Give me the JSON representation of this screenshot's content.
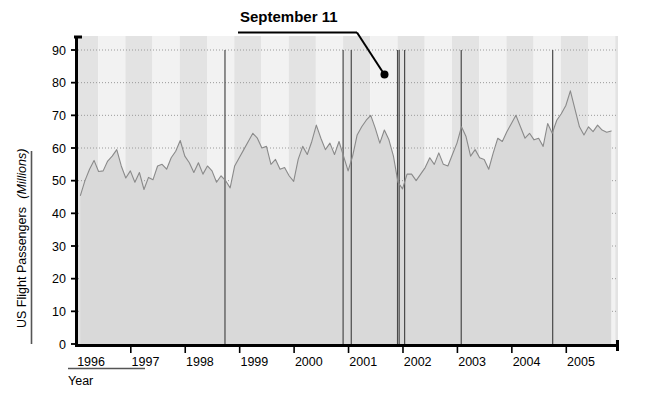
{
  "chart_data": {
    "type": "area",
    "title": "",
    "xlabel": "Year",
    "ylabel": "US Flight Passengers",
    "ylabel_unit": "(Millions)",
    "ylim": [
      0,
      90
    ],
    "xlim": [
      1995.58,
      2005.5
    ],
    "grid": true,
    "grid_style": "dotted-horizontal",
    "legend": "none",
    "ytick_labels": [
      "0",
      "10",
      "20",
      "30",
      "40",
      "50",
      "60",
      "70",
      "80",
      "90"
    ],
    "ytick_values": [
      0,
      10,
      20,
      30,
      40,
      50,
      60,
      70,
      80,
      90
    ],
    "xtick_labels": [
      "1996",
      "1997",
      "1998",
      "1999",
      "2000",
      "2001",
      "2002",
      "2003",
      "2004",
      "2005"
    ],
    "xtick_values": [
      1996,
      1997,
      1998,
      1999,
      2000,
      2001,
      2002,
      2003,
      2004,
      2005
    ],
    "series_name": "US Flight Passengers (Millions)",
    "line_color": "#8a8a8a",
    "fill_color": "#d9d9d9",
    "band_color": "#e3e3e3",
    "band_color_light": "#f2f2f2",
    "annotations": [
      {
        "label": "September  11",
        "x": 2001.7,
        "y": 81.5,
        "leader": true,
        "underline": true
      }
    ],
    "event_lines": [
      1998.28,
      2000.45,
      2000.6,
      2001.45,
      2001.48,
      2001.58,
      2002.62,
      2004.3
    ],
    "x": [
      1995.625,
      1995.708,
      1995.792,
      1995.875,
      1995.958,
      1996.042,
      1996.125,
      1996.208,
      1996.292,
      1996.375,
      1996.458,
      1996.542,
      1996.625,
      1996.708,
      1996.792,
      1996.875,
      1996.958,
      1997.042,
      1997.125,
      1997.208,
      1997.292,
      1997.375,
      1997.458,
      1997.542,
      1997.625,
      1997.708,
      1997.792,
      1997.875,
      1997.958,
      1998.042,
      1998.125,
      1998.208,
      1998.292,
      1998.375,
      1998.458,
      1998.542,
      1998.625,
      1998.708,
      1998.792,
      1998.875,
      1998.958,
      1999.042,
      1999.125,
      1999.208,
      1999.292,
      1999.375,
      1999.458,
      1999.542,
      1999.625,
      1999.708,
      1999.792,
      1999.875,
      1999.958,
      2000.042,
      2000.125,
      2000.208,
      2000.292,
      2000.375,
      2000.458,
      2000.542,
      2000.625,
      2000.708,
      2000.792,
      2000.875,
      2000.958,
      2001.042,
      2001.125,
      2001.208,
      2001.292,
      2001.375,
      2001.458,
      2001.542,
      2001.625,
      2001.708,
      2001.792,
      2001.875,
      2001.958,
      2002.042,
      2002.125,
      2002.208,
      2002.292,
      2002.375,
      2002.458,
      2002.542,
      2002.625,
      2002.708,
      2002.792,
      2002.875,
      2002.958,
      2003.042,
      2003.125,
      2003.208,
      2003.292,
      2003.375,
      2003.458,
      2003.542,
      2003.625,
      2003.708,
      2003.792,
      2003.875,
      2003.958,
      2004.042,
      2004.125,
      2004.208,
      2004.292,
      2004.375,
      2004.458,
      2004.542,
      2004.625,
      2004.708,
      2004.792,
      2004.875,
      2004.958,
      2005.042,
      2005.125,
      2005.208,
      2005.292,
      2005.375
    ],
    "values": [
      45.5,
      50.0,
      53.5,
      56.2,
      52.8,
      53.0,
      56.0,
      57.5,
      59.5,
      54.5,
      50.8,
      53.0,
      49.5,
      52.5,
      47.3,
      51.0,
      50.3,
      54.5,
      55.0,
      53.5,
      57.0,
      59.0,
      62.3,
      57.5,
      55.5,
      52.5,
      55.5,
      52.0,
      54.5,
      53.0,
      49.5,
      51.5,
      50.0,
      47.8,
      54.5,
      57.0,
      59.5,
      62.0,
      64.5,
      63.0,
      60.0,
      60.5,
      55.0,
      56.5,
      53.5,
      54.0,
      51.5,
      49.8,
      56.5,
      60.5,
      58.0,
      62.0,
      67.0,
      63.0,
      59.5,
      61.5,
      58.0,
      62.0,
      57.5,
      53.0,
      57.5,
      64.0,
      66.5,
      68.5,
      70.0,
      66.0,
      61.5,
      65.5,
      62.5,
      57.5,
      49.5,
      47.5,
      52.0,
      52.0,
      50.0,
      52.0,
      54.0,
      57.0,
      55.0,
      58.5,
      55.0,
      54.5,
      58.0,
      61.5,
      66.5,
      63.5,
      57.5,
      59.5,
      57.0,
      56.5,
      53.5,
      58.5,
      63.0,
      62.0,
      65.0,
      67.5,
      70.0,
      66.5,
      63.0,
      64.5,
      62.5,
      63.0,
      60.5,
      67.5,
      64.5,
      68.5,
      70.5,
      73.0,
      77.5,
      72.0,
      66.5,
      64.0,
      66.5,
      65.0,
      67.0,
      65.5,
      64.8,
      65.2
    ]
  },
  "axes": {
    "y_label_main": "US Flight Passengers",
    "y_label_unit": "(Millions)",
    "x_label": "Year"
  },
  "annotation": {
    "label": "September  11"
  }
}
